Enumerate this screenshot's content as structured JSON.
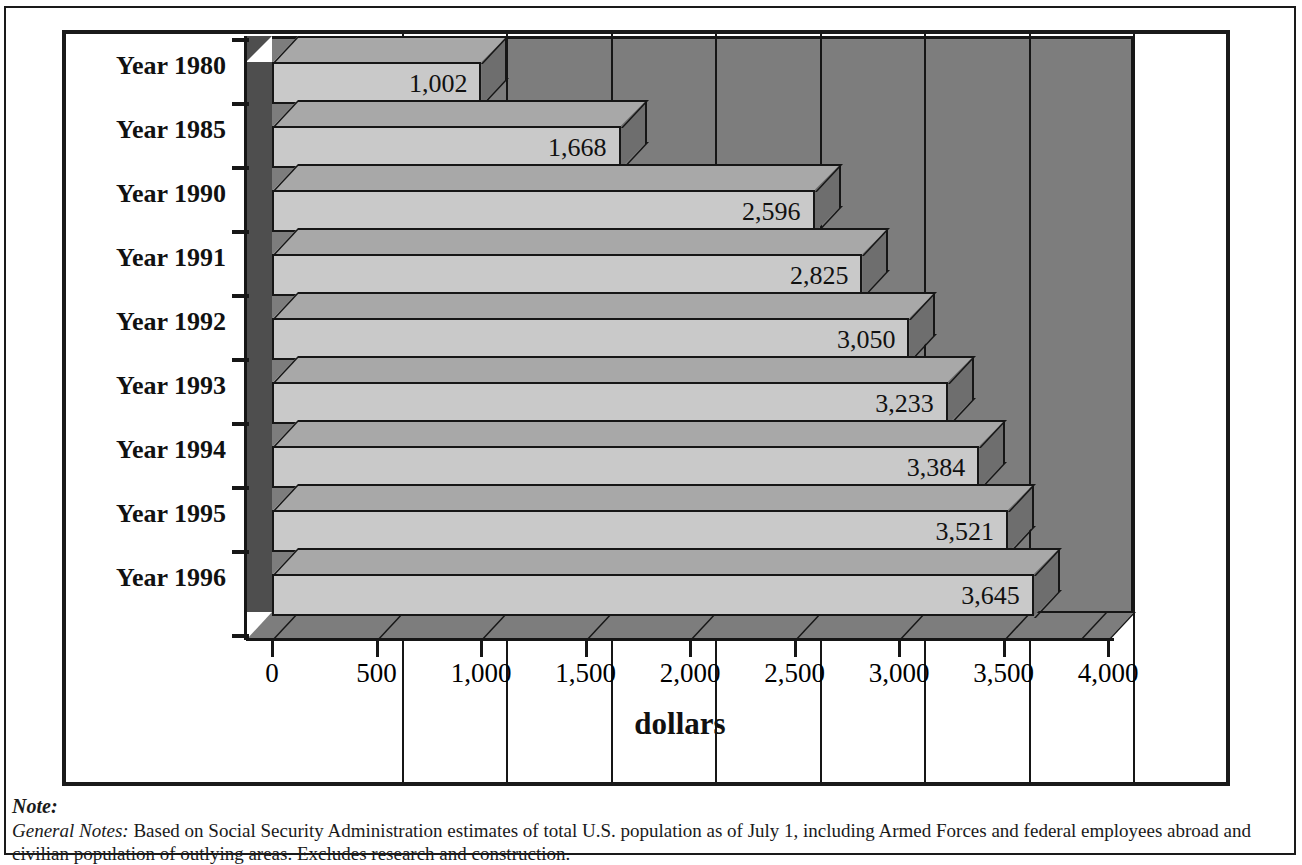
{
  "chart_data": {
    "type": "bar",
    "orientation": "horizontal",
    "title": "",
    "xlabel": "dollars",
    "ylabel": "",
    "categories": [
      "Year 1980",
      "Year 1985",
      "Year 1990",
      "Year 1991",
      "Year 1992",
      "Year 1993",
      "Year 1994",
      "Year 1995",
      "Year 1996"
    ],
    "values": [
      1002,
      1668,
      2596,
      2825,
      3050,
      3233,
      3384,
      3521,
      3645
    ],
    "value_labels": [
      "1,002",
      "1,668",
      "2,596",
      "2,825",
      "3,050",
      "3,233",
      "3,384",
      "3,521",
      "3,645"
    ],
    "xlim": [
      0,
      4000
    ],
    "xticks": [
      0,
      500,
      1000,
      1500,
      2000,
      2500,
      3000,
      3500,
      4000
    ],
    "xtick_labels": [
      "0",
      "500",
      "1,000",
      "1,500",
      "2,000",
      "2,500",
      "3,000",
      "3,500",
      "4,000"
    ],
    "grid": true,
    "legend": null,
    "style": "3d-bar",
    "colors": {
      "bar_face": "#c9c9c9",
      "bar_top": "#a8a8a8",
      "bar_side": "#6e6e6e",
      "plot_background": "#7d7d7d",
      "side_wall": "#4e4e4e",
      "axis": "#161616",
      "text": "#111111",
      "page_background": "#ffffff"
    }
  },
  "footnotes": {
    "heading": "Note:",
    "lead": "General Notes:",
    "body": "Based on Social Security Administration estimates of total U.S. population as of July 1, including Armed Forces and federal employees abroad and civilian population of outlying areas. Excludes research and construction."
  }
}
